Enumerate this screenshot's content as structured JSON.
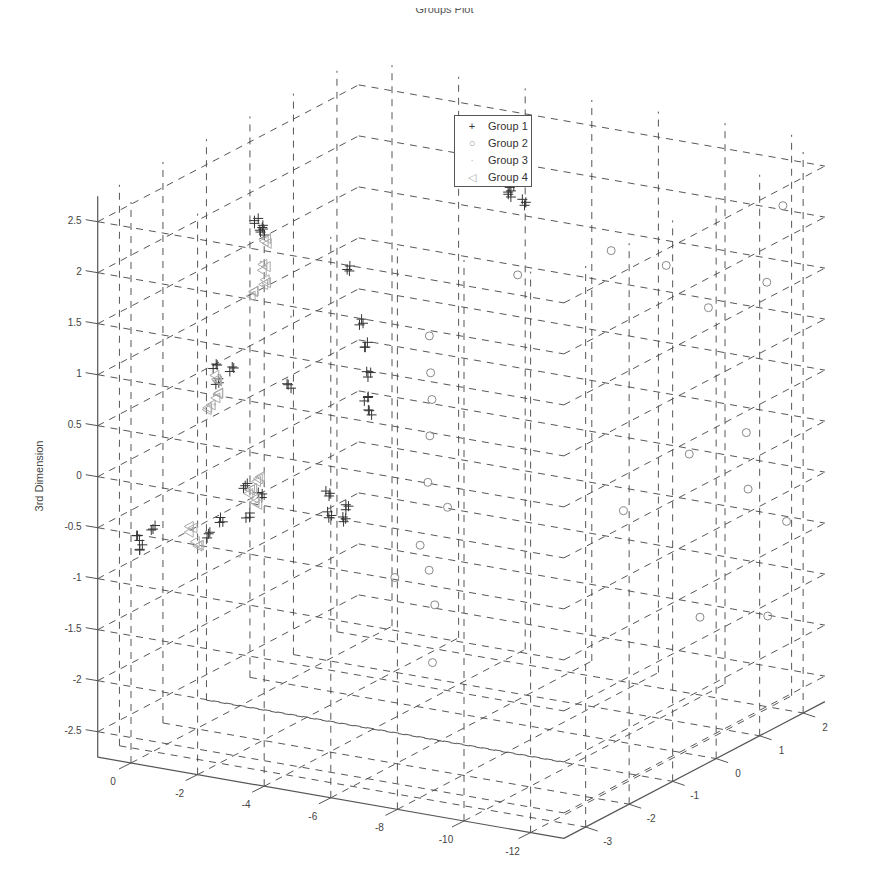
{
  "chart_data": {
    "type": "scatter",
    "subtype": "3d-scatter",
    "title": "Groups Plot",
    "xlabel": "",
    "ylabel": "",
    "zlabel": "3rd Dimension",
    "xlim": [
      -13,
      1
    ],
    "ylim": [
      -3.5,
      2.5
    ],
    "zlim": [
      -2.75,
      2.75
    ],
    "x_ticks": [
      "0",
      "-2",
      "-4",
      "-6",
      "-8",
      "-10",
      "-12"
    ],
    "y_ticks": [
      "-3",
      "-2",
      "-1",
      "0",
      "1",
      "2"
    ],
    "z_ticks": [
      "2.5",
      "2",
      "1.5",
      "1",
      "0.5",
      "0",
      "-0.5",
      "-1",
      "-1.5",
      "-2",
      "-2.5"
    ],
    "grid": true,
    "grid_style": "dashed",
    "legend_position": "top-center",
    "series": [
      {
        "name": "Group 1",
        "marker": "+",
        "color": "#333333",
        "points_approx": [
          [
            -6.2,
            0.5,
            2.6
          ],
          [
            -6.4,
            0.4,
            2.4
          ],
          [
            -6.0,
            0.3,
            2.5
          ],
          [
            -6.5,
            0.6,
            2.2
          ],
          [
            -6.1,
            0.5,
            2.3
          ],
          [
            -5.4,
            -2.3,
            1.6
          ],
          [
            -5.6,
            -2.4,
            1.4
          ],
          [
            -5.5,
            -2.2,
            1.1
          ],
          [
            -5.7,
            -2.5,
            0.9
          ],
          [
            -5.3,
            -2.1,
            0.7
          ],
          [
            -1.6,
            -1.8,
            2.3
          ],
          [
            -1.8,
            -1.9,
            2.2
          ],
          [
            -2.0,
            -2.0,
            2.3
          ],
          [
            -0.9,
            -2.3,
            0.9
          ],
          [
            -1.2,
            -2.4,
            0.8
          ],
          [
            -1.4,
            -2.3,
            0.9
          ],
          [
            -5.2,
            -3.0,
            0.1
          ],
          [
            -5.5,
            -3.1,
            -0.1
          ],
          [
            -5.8,
            -3.0,
            0.0
          ],
          [
            -5.6,
            -2.9,
            -0.2
          ],
          [
            -3.3,
            -3.1,
            0.0
          ],
          [
            -3.1,
            -3.2,
            0.1
          ],
          [
            -2.8,
            -3.0,
            -0.3
          ],
          [
            0.2,
            -3.2,
            -0.6
          ],
          [
            0.0,
            -3.3,
            -0.7
          ],
          [
            -0.2,
            -3.1,
            -0.5
          ],
          [
            -2.2,
            -3.4,
            -0.4
          ],
          [
            -2.4,
            -3.3,
            -0.3
          ],
          [
            -3.5,
            -2.5,
            0.9
          ],
          [
            -4.6,
            -2.0,
            2.0
          ]
        ]
      },
      {
        "name": "Group 2",
        "marker": "o",
        "color": "#888888",
        "points_approx": [
          [
            -7.0,
            -2.0,
            1.5
          ],
          [
            -7.3,
            -2.2,
            1.2
          ],
          [
            -7.6,
            -2.4,
            1.0
          ],
          [
            -7.8,
            -2.6,
            0.7
          ],
          [
            -8.0,
            -2.8,
            0.3
          ],
          [
            -8.2,
            -2.5,
            0.0
          ],
          [
            -7.9,
            -2.9,
            -0.3
          ],
          [
            -8.3,
            -3.0,
            -0.5
          ],
          [
            -8.6,
            -3.1,
            -0.8
          ],
          [
            -7.4,
            -3.1,
            -0.6
          ],
          [
            -9.0,
            -1.5,
            2.1
          ],
          [
            -10.5,
            -0.5,
            2.2
          ],
          [
            -11.5,
            0.0,
            2.0
          ],
          [
            -12.0,
            2.3,
            2.1
          ],
          [
            -11.2,
            1.2,
            1.3
          ],
          [
            -12.3,
            1.7,
            1.5
          ],
          [
            -11.8,
            0.3,
            0.1
          ],
          [
            -12.6,
            1.0,
            0.2
          ],
          [
            -11.0,
            -0.6,
            -0.3
          ],
          [
            -12.0,
            1.5,
            -0.5
          ],
          [
            -12.5,
            2.0,
            -0.9
          ],
          [
            -11.6,
            0.7,
            -1.6
          ],
          [
            -12.2,
            1.8,
            -1.8
          ],
          [
            -8.4,
            -3.0,
            -1.4
          ]
        ]
      },
      {
        "name": "Group 3",
        "marker": ".",
        "color": "#bbbbbb",
        "points_approx": [
          [
            -2.2,
            -2.2,
            2.0
          ],
          [
            -2.4,
            -2.3,
            1.8
          ],
          [
            -3.5,
            -2.5,
            1.6
          ],
          [
            -1.6,
            -2.8,
            0.7
          ],
          [
            -3.0,
            -3.3,
            -0.6
          ]
        ]
      },
      {
        "name": "Group 4",
        "marker": "<",
        "color": "#aaaaaa",
        "points_approx": [
          [
            -2.0,
            -1.9,
            2.1
          ],
          [
            -2.1,
            -2.0,
            1.9
          ],
          [
            -2.2,
            -2.1,
            1.8
          ],
          [
            -2.0,
            -2.2,
            1.7
          ],
          [
            -1.0,
            -2.3,
            0.8
          ],
          [
            -1.2,
            -2.4,
            0.7
          ],
          [
            -1.1,
            -2.5,
            0.6
          ],
          [
            -3.0,
            -3.0,
            0.0
          ],
          [
            -3.2,
            -3.1,
            -0.1
          ],
          [
            -3.1,
            -2.9,
            0.1
          ],
          [
            -1.6,
            -3.3,
            -0.4
          ],
          [
            -1.8,
            -3.4,
            -0.5
          ]
        ]
      }
    ]
  },
  "labels": {
    "title": "Groups Plot",
    "zlabel": "3rd Dimension"
  },
  "legend": {
    "items": [
      {
        "label": "Group 1",
        "marker": "+",
        "color": "#333333"
      },
      {
        "label": "Group 2",
        "marker": "○",
        "color": "#999999"
      },
      {
        "label": "Group 3",
        "marker": "·",
        "color": "#bbbbbb"
      },
      {
        "label": "Group 4",
        "marker": "◁",
        "color": "#aaaaaa"
      }
    ]
  },
  "colors": {
    "axis": "#555555",
    "grid": "#444444",
    "text": "#444444"
  }
}
